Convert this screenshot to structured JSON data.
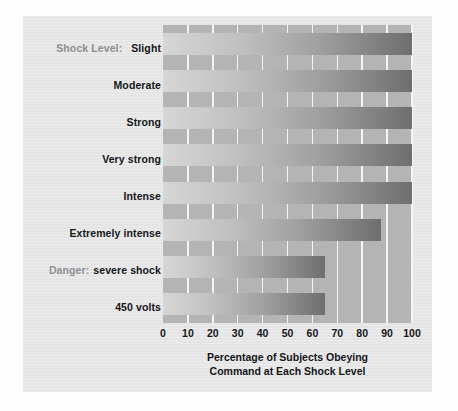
{
  "chart_data": {
    "type": "bar",
    "orientation": "horizontal",
    "title": "",
    "xlabel_line1": "Percentage of Subjects Obeying",
    "xlabel_line2": "Command at Each Shock Level",
    "ylabel": "Shock Level:",
    "categories": [
      "Slight",
      "Moderate",
      "Strong",
      "Very strong",
      "Intense",
      "Extremely intense",
      "Danger: severe shock",
      "450 volts"
    ],
    "category_prefixes": [
      "Shock Level:",
      "",
      "",
      "",
      "",
      "",
      "Danger:",
      ""
    ],
    "category_mains": [
      "Slight",
      "Moderate",
      "Strong",
      "Very strong",
      "Intense",
      "Extremely intense",
      "severe shock",
      "450 volts"
    ],
    "values": [
      100,
      100,
      100,
      100,
      100,
      87.5,
      65,
      65
    ],
    "xlim": [
      0,
      100
    ],
    "xticks": [
      0,
      10,
      20,
      30,
      40,
      50,
      60,
      70,
      80,
      90,
      100
    ],
    "xtick_labels": [
      "0",
      "10",
      "20",
      "30",
      "40",
      "50",
      "60",
      "70",
      "80",
      "90",
      "100"
    ],
    "grid": true,
    "legend": false,
    "colors": {
      "panel_background": "#e7e7e7",
      "plot_background": "#b4b4b4",
      "gridline": "#f4f4f4",
      "bar_light": "#d6d6d6",
      "bar_dark": "#6e6e6e",
      "label_text": "#14161a",
      "prefix_text": "#8b8f93"
    }
  }
}
